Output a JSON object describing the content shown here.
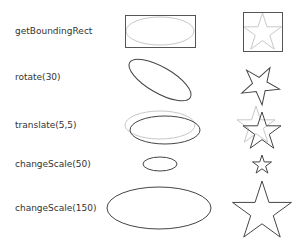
{
  "rows": [
    {
      "label": "getBoundingRect",
      "y": 31
    },
    {
      "label": "rotate(30)",
      "y": 77
    },
    {
      "label": "translate(5,5)",
      "y": 125
    },
    {
      "label": "changeScale(50)",
      "y": 164
    },
    {
      "label": "changeScale(150)",
      "y": 208
    }
  ],
  "colors": {
    "shape_stroke": "#444444",
    "ghost_stroke": "#c8c8c8",
    "text": "#333333"
  }
}
